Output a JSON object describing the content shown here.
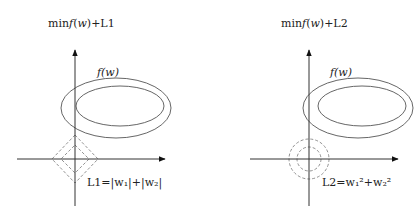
{
  "panels": [
    {
      "title": "minf(w)+L1",
      "title_parts": {
        "min": "min",
        "f": "f",
        "w": "w",
        "suffix": "+L1"
      },
      "contour_label": "f(w)",
      "constraint_label": "L1=|w₁|+|w₂|",
      "constraint_shape": "diamond"
    },
    {
      "title": "minf(w)+L2",
      "title_parts": {
        "min": "min",
        "f": "f",
        "w": "w",
        "suffix": "+L2"
      },
      "contour_label": "f(w)",
      "constraint_label": "L2=w₁²+w₂²",
      "constraint_shape": "circle"
    }
  ],
  "colors": {
    "line": "#444444",
    "dashed": "#777777",
    "text": "#222222"
  }
}
